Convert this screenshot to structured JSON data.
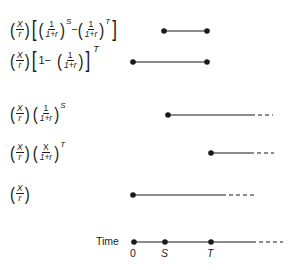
{
  "rows": [
    {
      "id": "row1",
      "formula": {
        "prefix_num": "X",
        "prefix_den": "r",
        "term1_num": "1",
        "term1_den": "1+r",
        "term1_exp": "S",
        "minus": "−",
        "term2_num": "1",
        "term2_den": "1+r",
        "term2_exp": "T"
      },
      "segment": {
        "start_x": 164,
        "end_x": 207,
        "y": 31,
        "start_dot": true,
        "end_dot": true,
        "dashed_extension": false
      }
    },
    {
      "id": "row2",
      "formula": {
        "prefix_num": "X",
        "prefix_den": "r",
        "one": "1−",
        "term_num": "1",
        "term_den": "1+r",
        "outer_exp": "T"
      },
      "segment": {
        "start_x": 133,
        "end_x": 207,
        "y": 62,
        "start_dot": true,
        "end_dot": true,
        "dashed_extension": false
      }
    },
    {
      "id": "row3",
      "formula": {
        "prefix_num": "X",
        "prefix_den": "r",
        "term_num": "1",
        "term_den": "1+r",
        "term_exp": "S"
      },
      "segment": {
        "start_x": 168,
        "solid_end_x": 251,
        "dash_end_x": 273,
        "y": 115,
        "start_dot": true,
        "dashed_extension": true
      }
    },
    {
      "id": "row4",
      "formula": {
        "prefix_num": "X",
        "prefix_den": "r",
        "term_num": "X",
        "term_den": "1+r",
        "term_exp": "T"
      },
      "segment": {
        "start_x": 211,
        "solid_end_x": 250,
        "dash_end_x": 274,
        "y": 153,
        "start_dot": true,
        "dashed_extension": true
      }
    },
    {
      "id": "row5",
      "formula": {
        "prefix_num": "X",
        "prefix_den": "r"
      },
      "segment": {
        "start_x": 133,
        "solid_end_x": 222,
        "dash_end_x": 256,
        "y": 195,
        "start_dot": true,
        "dashed_extension": true
      }
    }
  ],
  "timeline": {
    "label": "Time",
    "y": 242,
    "points": [
      {
        "label": "0",
        "x": 134,
        "italic": false
      },
      {
        "label": "S",
        "x": 165,
        "italic": true
      },
      {
        "label": "T",
        "x": 211,
        "italic": true
      }
    ],
    "solid_end_x": 252,
    "dash_end_x": 283
  },
  "colors": {
    "line": "#1a1a1a",
    "background": "#ffffff"
  }
}
